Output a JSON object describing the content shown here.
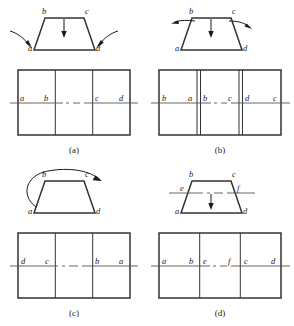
{
  "figure": {
    "panel_count": 4,
    "stroke_color": "#333333",
    "label_color": "#1a1a1a",
    "centerline_color": "#555555"
  },
  "panels": [
    {
      "id": "a",
      "caption": "(a)",
      "shape": {
        "type": "trapezoid",
        "vertex_labels": {
          "top_left": "b",
          "top_right": "c",
          "bottom_left": "a",
          "bottom_right": "d"
        }
      },
      "arrows": [
        {
          "name": "down-arrow-top",
          "kind": "straight",
          "direction": "down"
        },
        {
          "name": "curved-arrow-bottom-left",
          "kind": "curved",
          "direction": "inward-left"
        },
        {
          "name": "curved-arrow-bottom-right",
          "kind": "curved",
          "direction": "inward-right"
        }
      ],
      "grid": {
        "cells": 3,
        "double_dividers": false,
        "cell_labels": [
          [
            "a",
            "b"
          ],
          [
            "",
            ""
          ],
          [
            "c",
            "d"
          ]
        ]
      }
    },
    {
      "id": "b",
      "caption": "(b)",
      "shape": {
        "type": "trapezoid",
        "vertex_labels": {
          "top_left": "b",
          "top_right": "c",
          "bottom_left": "a",
          "bottom_right": "d"
        }
      },
      "arrows": [
        {
          "name": "down-arrow-top",
          "kind": "straight",
          "direction": "down"
        },
        {
          "name": "curved-arrow-top-left",
          "kind": "curved",
          "direction": "outward-left"
        },
        {
          "name": "curved-arrow-top-right",
          "kind": "curved",
          "direction": "outward-right"
        }
      ],
      "grid": {
        "cells": 3,
        "double_dividers": true,
        "cell_labels": [
          [
            "b",
            "a"
          ],
          [
            "b",
            "c"
          ],
          [
            "d",
            "c"
          ]
        ]
      }
    },
    {
      "id": "c",
      "caption": "(c)",
      "shape": {
        "type": "trapezoid",
        "vertex_labels": {
          "top_left": "b",
          "top_right": "c",
          "bottom_left": "a",
          "bottom_right": "d"
        }
      },
      "arrows": [
        {
          "name": "rotation-arc-arrow",
          "kind": "arc",
          "direction": "clockwise-over-top"
        }
      ],
      "grid": {
        "cells": 3,
        "double_dividers": false,
        "cell_labels": [
          [
            "d",
            "c"
          ],
          [
            "",
            ""
          ],
          [
            "b",
            "a"
          ]
        ]
      }
    },
    {
      "id": "d",
      "caption": "(d)",
      "shape": {
        "type": "trapezoid",
        "vertex_labels": {
          "top_left": "b",
          "top_right": "c",
          "bottom_left": "a",
          "bottom_right": "d"
        },
        "section_labels": {
          "left": "e",
          "right": "f"
        },
        "has_section_centerline": true
      },
      "arrows": [
        {
          "name": "down-arrow-center",
          "kind": "straight",
          "direction": "down"
        }
      ],
      "grid": {
        "cells": 3,
        "double_dividers": false,
        "cell_labels": [
          [
            "a",
            "b"
          ],
          [
            "e",
            "f"
          ],
          [
            "c",
            "d"
          ]
        ]
      }
    }
  ]
}
